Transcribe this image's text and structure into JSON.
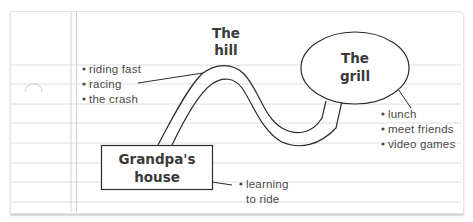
{
  "diagram": {
    "type": "story-map-on-index-card",
    "nodes": [
      {
        "id": "hill",
        "title_lines": [
          "The",
          "hill"
        ],
        "shape": "text"
      },
      {
        "id": "grill",
        "title_lines": [
          "The",
          "grill"
        ],
        "shape": "ellipse"
      },
      {
        "id": "grandpa",
        "title_lines": [
          "Grandpa's",
          "house"
        ],
        "shape": "rectangle"
      }
    ],
    "notes": {
      "hill": [
        "riding fast",
        "racing",
        "the crash"
      ],
      "grill": [
        "lunch",
        "meet friends",
        "video games"
      ],
      "grandpa": [
        "learning",
        "to ride"
      ]
    },
    "edges": [
      {
        "from": "grandpa",
        "to": "hill",
        "style": "road"
      },
      {
        "from": "hill",
        "to": "grill",
        "style": "road"
      }
    ],
    "colors": {
      "ink": "#2b2b2b",
      "ruled_line": "#dcdcdc",
      "margin_line": "#d4d4d4",
      "text": "#4a4a4a"
    }
  }
}
